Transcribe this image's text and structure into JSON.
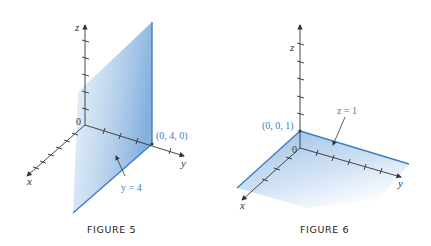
{
  "figures": [
    {
      "id": "figure-5",
      "caption": "FIGURE 5",
      "axes": {
        "x": "x",
        "y": "y",
        "z": "z"
      },
      "origin_label": "0",
      "point_label": "(0, 4, 0)",
      "plane_label": "y = 4",
      "plane_equation": "y = 4"
    },
    {
      "id": "figure-6",
      "caption": "FIGURE 6",
      "axes": {
        "x": "x",
        "y": "y",
        "z": "z"
      },
      "origin_label": "0",
      "point_label": "(0, 0, 1)",
      "plane_label": "z = 1",
      "plane_equation": "z = 1"
    }
  ],
  "colors": {
    "plane_fill": "#a9c9ea",
    "plane_edge": "#3b7fc4",
    "axis": "#333333",
    "label_accent": "#3b7fc4"
  }
}
